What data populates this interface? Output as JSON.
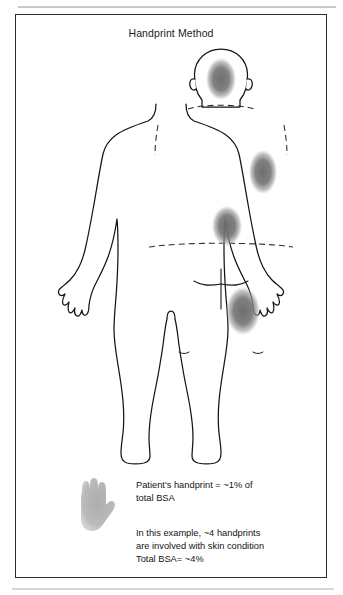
{
  "figure": {
    "title": "Handprint Method",
    "view": "posterior body outline",
    "accent_color": "#6f6f6f",
    "outline_color": "#1a1a1a"
  },
  "captions": {
    "handprint_rule": "Patient's handprint  =  ~1% of\ntotal BSA",
    "example": "In this example, ~4 handprints\nare involved with skin condition\nTotal BSA= ~4%"
  },
  "legend": {
    "hand_icon_label": "handprint-silhouette"
  },
  "lesions": [
    {
      "name": "lesion-head",
      "region": "occiput / back of head",
      "cx": 205,
      "cy": 38,
      "rx": 15,
      "ry": 21
    },
    {
      "name": "lesion-left-shoulder",
      "region": "left posterior shoulder / upper arm",
      "cx": 247,
      "cy": 131,
      "rx": 14,
      "ry": 22
    },
    {
      "name": "lesion-mid-back",
      "region": "mid back",
      "cx": 211,
      "cy": 185,
      "rx": 15,
      "ry": 20
    },
    {
      "name": "lesion-right-thigh",
      "region": "right posterior thigh",
      "cx": 227,
      "cy": 270,
      "rx": 17,
      "ry": 24
    }
  ],
  "reference_lines": [
    {
      "name": "neck-shoulder-line",
      "style": "dashed"
    },
    {
      "name": "right-axilla-line",
      "style": "dashed"
    },
    {
      "name": "left-axilla-line",
      "style": "dashed"
    },
    {
      "name": "waist-line",
      "style": "dashed"
    }
  ]
}
